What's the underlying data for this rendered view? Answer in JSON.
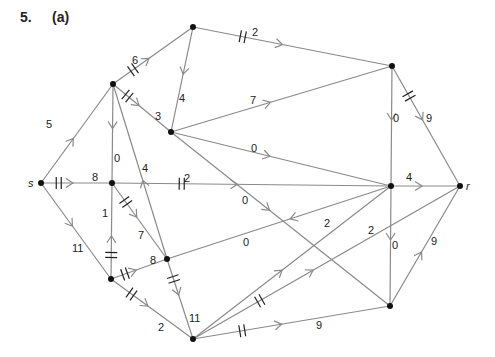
{
  "problem": {
    "number": "5.",
    "part": "(a)"
  },
  "colors": {
    "edge": "#8a8a8a",
    "node": "#111111",
    "text": "#222222",
    "tick": "#222222"
  },
  "nodes": [
    {
      "id": "s",
      "x": 41,
      "y": 183,
      "label": "s",
      "lx": 28,
      "ly": 187
    },
    {
      "id": "A",
      "x": 113,
      "y": 84,
      "label": ""
    },
    {
      "id": "B",
      "x": 193,
      "y": 27,
      "label": ""
    },
    {
      "id": "C",
      "x": 171,
      "y": 132,
      "label": ""
    },
    {
      "id": "D",
      "x": 392,
      "y": 66,
      "label": ""
    },
    {
      "id": "E",
      "x": 112,
      "y": 183,
      "label": ""
    },
    {
      "id": "F",
      "x": 391,
      "y": 186,
      "label": ""
    },
    {
      "id": "r",
      "x": 460,
      "y": 186,
      "label": "r",
      "lx": 466,
      "ly": 190
    },
    {
      "id": "G",
      "x": 111,
      "y": 279,
      "label": ""
    },
    {
      "id": "H",
      "x": 167,
      "y": 259,
      "label": ""
    },
    {
      "id": "I",
      "x": 193,
      "y": 339,
      "label": ""
    },
    {
      "id": "J",
      "x": 390,
      "y": 306,
      "label": ""
    }
  ],
  "edges": [
    {
      "from": "s",
      "to": "A",
      "flow": "5",
      "lx": 46,
      "ly": 128,
      "tick": false
    },
    {
      "from": "s",
      "to": "E",
      "flow": "8",
      "lx": 92,
      "ly": 181,
      "tick": true
    },
    {
      "from": "s",
      "to": "G",
      "flow": "11",
      "lx": 72,
      "ly": 252,
      "tick": false
    },
    {
      "from": "A",
      "to": "B",
      "flow": "6",
      "lx": 132,
      "ly": 64,
      "tick": true
    },
    {
      "from": "A",
      "to": "C",
      "flow": "3",
      "lx": 155,
      "ly": 120,
      "tick": true
    },
    {
      "from": "A",
      "to": "E",
      "flow": "0",
      "lx": 114,
      "ly": 162,
      "tick": false
    },
    {
      "from": "H",
      "to": "A",
      "flow": "4",
      "lx": 142,
      "ly": 172,
      "tick": false
    },
    {
      "from": "B",
      "to": "C",
      "flow": "4",
      "lx": 179,
      "ly": 102,
      "tick": false
    },
    {
      "from": "B",
      "to": "D",
      "flow": "2",
      "lx": 252,
      "ly": 36,
      "tick": true
    },
    {
      "from": "C",
      "to": "D",
      "flow": "7",
      "lx": 250,
      "ly": 104,
      "tick": false
    },
    {
      "from": "C",
      "to": "F",
      "flow": "0",
      "lx": 251,
      "ly": 152,
      "tick": false
    },
    {
      "from": "C",
      "to": "J",
      "flow": "0",
      "lx": 242,
      "ly": 204,
      "tick": false
    },
    {
      "from": "D",
      "to": "F",
      "flow": "0",
      "lx": 393,
      "ly": 122,
      "tick": false
    },
    {
      "from": "D",
      "to": "r",
      "flow": "9",
      "lx": 426,
      "ly": 122,
      "tick": true
    },
    {
      "from": "E",
      "to": "F",
      "flow": "2",
      "lx": 184,
      "ly": 182,
      "tick": true
    },
    {
      "from": "E",
      "to": "H",
      "flow": "7",
      "lx": 138,
      "ly": 239,
      "tick": true
    },
    {
      "from": "G",
      "to": "E",
      "flow": "1",
      "lx": 102,
      "ly": 217,
      "tick": true
    },
    {
      "from": "F",
      "to": "r",
      "flow": "4",
      "lx": 406,
      "ly": 181,
      "tick": false
    },
    {
      "from": "F",
      "to": "H",
      "flow": "0",
      "lx": 243,
      "ly": 246,
      "tick": false
    },
    {
      "from": "F",
      "to": "J",
      "flow": "0",
      "lx": 392,
      "ly": 249,
      "tick": false
    },
    {
      "from": "G",
      "to": "H",
      "flow": "8",
      "lx": 150,
      "ly": 264,
      "tick": true
    },
    {
      "from": "G",
      "to": "I",
      "flow": "2",
      "lx": 158,
      "ly": 331,
      "tick": true
    },
    {
      "from": "H",
      "to": "I",
      "flow": "11",
      "lx": 189,
      "ly": 322,
      "tick": true
    },
    {
      "from": "I",
      "to": "F",
      "flow": "2",
      "lx": 324,
      "ly": 227,
      "tick": false
    },
    {
      "from": "I",
      "to": "r",
      "flow": "2",
      "lx": 368,
      "ly": 234,
      "tick": true
    },
    {
      "from": "I",
      "to": "J",
      "flow": "9",
      "lx": 316,
      "ly": 329,
      "tick": true
    },
    {
      "from": "J",
      "to": "r",
      "flow": "9",
      "lx": 431,
      "ly": 245,
      "tick": false
    }
  ]
}
